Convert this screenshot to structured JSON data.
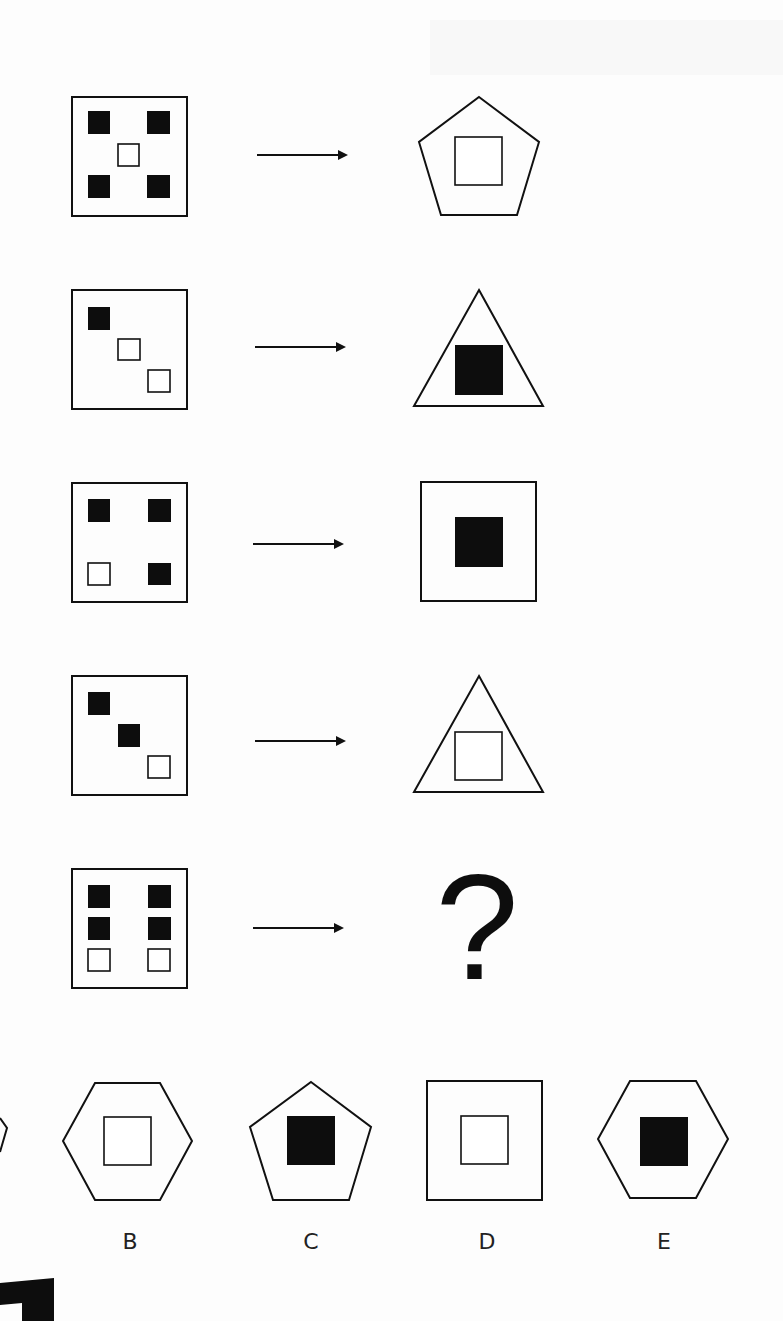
{
  "puzzle": {
    "type": "shape-analogy",
    "rows": [
      {
        "id": 1,
        "input": {
          "frame": "square",
          "cells": [
            {
              "pos": "top-left",
              "fill": "solid"
            },
            {
              "pos": "top-right",
              "fill": "solid"
            },
            {
              "pos": "center",
              "fill": "hollow"
            },
            {
              "pos": "bottom-left",
              "fill": "solid"
            },
            {
              "pos": "bottom-right",
              "fill": "solid"
            }
          ]
        },
        "output": {
          "outer": "pentagon",
          "inner_fill": "hollow"
        }
      },
      {
        "id": 2,
        "input": {
          "frame": "square",
          "cells": [
            {
              "pos": "top-left",
              "fill": "solid"
            },
            {
              "pos": "center",
              "fill": "hollow"
            },
            {
              "pos": "bottom-right",
              "fill": "hollow"
            }
          ]
        },
        "output": {
          "outer": "triangle",
          "inner_fill": "solid"
        }
      },
      {
        "id": 3,
        "input": {
          "frame": "square",
          "cells": [
            {
              "pos": "top-left",
              "fill": "solid"
            },
            {
              "pos": "top-right",
              "fill": "solid"
            },
            {
              "pos": "bottom-left",
              "fill": "hollow"
            },
            {
              "pos": "bottom-right",
              "fill": "solid"
            }
          ]
        },
        "output": {
          "outer": "square",
          "inner_fill": "solid"
        }
      },
      {
        "id": 4,
        "input": {
          "frame": "square",
          "cells": [
            {
              "pos": "top-left",
              "fill": "solid"
            },
            {
              "pos": "center",
              "fill": "solid"
            },
            {
              "pos": "bottom-right",
              "fill": "hollow"
            }
          ]
        },
        "output": {
          "outer": "triangle",
          "inner_fill": "hollow"
        }
      },
      {
        "id": 5,
        "input": {
          "frame": "square",
          "cells": [
            {
              "pos": "top-left",
              "fill": "solid"
            },
            {
              "pos": "top-right",
              "fill": "solid"
            },
            {
              "pos": "middle-left",
              "fill": "solid"
            },
            {
              "pos": "middle-right",
              "fill": "solid"
            },
            {
              "pos": "bottom-left",
              "fill": "hollow"
            },
            {
              "pos": "bottom-right",
              "fill": "hollow"
            }
          ]
        },
        "output": {
          "unknown": true,
          "symbol": "?"
        }
      }
    ],
    "arrow_icon": "right-arrow-icon",
    "options": [
      {
        "label": "A",
        "outer": "partially-visible",
        "inner_fill": "unknown",
        "label_visible": false
      },
      {
        "label": "B",
        "outer": "hexagon",
        "inner_fill": "hollow"
      },
      {
        "label": "C",
        "outer": "pentagon",
        "inner_fill": "solid"
      },
      {
        "label": "D",
        "outer": "square",
        "inner_fill": "hollow"
      },
      {
        "label": "E",
        "outer": "hexagon",
        "inner_fill": "solid"
      }
    ],
    "colors": {
      "ink": "#111111",
      "paper": "#fdfdfd"
    }
  }
}
